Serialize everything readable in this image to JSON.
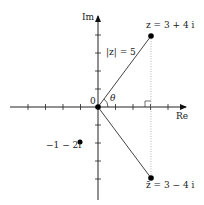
{
  "diagram": {
    "type": "complex-plane",
    "axes": {
      "x_label": "Re",
      "y_label": "Im",
      "origin_label": "0"
    },
    "angle_label": "θ",
    "points": [
      {
        "label": "z = 3 + 4 i",
        "re": 3,
        "im": 4
      },
      {
        "label": "z̄ = 3 − 4 i",
        "re": 3,
        "im": -4
      },
      {
        "label": "−1 − 2i",
        "re": -1,
        "im": -2
      }
    ],
    "modulus_label": "|z| = 5"
  }
}
